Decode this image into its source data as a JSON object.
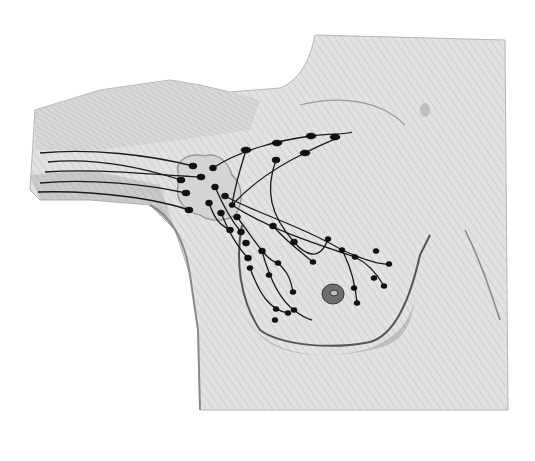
{
  "illustration": {
    "subject": "pencil drawing of axillary and breast lymphatic drainage",
    "colors": {
      "background": "#ffffff",
      "skin": "#d9d9d9",
      "skin_light": "#e6e6e6",
      "shading": "#9a9a9a",
      "ink": "#1a1a1a"
    },
    "nodes": [
      [
        193,
        166
      ],
      [
        181,
        180
      ],
      [
        201,
        177
      ],
      [
        186,
        193
      ],
      [
        189,
        210
      ],
      [
        213,
        168
      ],
      [
        215,
        187
      ],
      [
        209,
        203
      ],
      [
        225,
        196
      ],
      [
        221,
        213
      ],
      [
        232,
        205
      ],
      [
        246,
        150
      ],
      [
        277,
        143
      ],
      [
        311,
        136
      ],
      [
        335,
        137
      ],
      [
        305,
        153
      ],
      [
        276,
        160
      ],
      [
        237,
        217
      ],
      [
        230,
        230
      ],
      [
        241,
        232
      ],
      [
        273,
        226
      ],
      [
        262,
        251
      ],
      [
        246,
        243
      ],
      [
        248,
        258
      ],
      [
        294,
        242
      ],
      [
        313,
        262
      ],
      [
        269,
        275
      ],
      [
        250,
        268
      ],
      [
        278,
        263
      ],
      [
        328,
        239
      ],
      [
        342,
        250
      ],
      [
        355,
        257
      ],
      [
        376,
        251
      ],
      [
        389,
        264
      ],
      [
        374,
        278
      ],
      [
        384,
        286
      ],
      [
        293,
        292
      ],
      [
        294,
        310
      ],
      [
        276,
        309
      ],
      [
        275,
        320
      ],
      [
        288,
        313
      ],
      [
        354,
        288
      ],
      [
        357,
        303
      ]
    ]
  }
}
